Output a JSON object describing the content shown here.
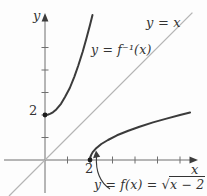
{
  "figure": {
    "type": "math-function-plot",
    "background": "#fdfdfd",
    "curve_color": "#3b3b3b",
    "identity_line_color": "#b5b5b5",
    "axis_color": "#6f6f6f",
    "text_color": "#333333"
  },
  "labels": {
    "y_axis": "y",
    "x_axis": "x",
    "y_intercept_tick": "2",
    "x_intercept_tick": "2",
    "inverse_curve": "y = f⁻¹(x)",
    "identity_line": "y = x",
    "f_curve_prefix": "y = f(x) = ",
    "f_curve_radical": "√",
    "f_curve_radicand": "x − 2"
  },
  "chart_data": {
    "type": "line",
    "xlabel": "x",
    "ylabel": "y",
    "xlim": [
      -1.8,
      6.8
    ],
    "ylim": [
      -1.6,
      6.5
    ],
    "grid": false,
    "x_ticks": [
      1,
      2,
      3,
      4,
      5,
      6
    ],
    "y_ticks": [
      1,
      2,
      3,
      4,
      5
    ],
    "series": [
      {
        "name": "y = x",
        "style": "identity",
        "points": [
          [
            -1.6,
            -1.6
          ],
          [
            6.55,
            6.55
          ]
        ]
      },
      {
        "name": "y = f(x) = √(x − 2)",
        "style": "curve",
        "points": [
          [
            2,
            0
          ],
          [
            2.02,
            0.14
          ],
          [
            2.05,
            0.22
          ],
          [
            2.12,
            0.35
          ],
          [
            2.25,
            0.5
          ],
          [
            2.5,
            0.71
          ],
          [
            2.8,
            0.89
          ],
          [
            3.2,
            1.1
          ],
          [
            3.7,
            1.3
          ],
          [
            4.2,
            1.48
          ],
          [
            4.8,
            1.67
          ],
          [
            5.4,
            1.84
          ],
          [
            6.0,
            2.0
          ],
          [
            6.45,
            2.11
          ]
        ]
      },
      {
        "name": "y = f⁻¹(x) = x² + 2",
        "style": "curve",
        "points": [
          [
            0,
            2
          ],
          [
            0.14,
            2.02
          ],
          [
            0.22,
            2.05
          ],
          [
            0.35,
            2.12
          ],
          [
            0.5,
            2.25
          ],
          [
            0.71,
            2.5
          ],
          [
            0.89,
            2.8
          ],
          [
            1.1,
            3.2
          ],
          [
            1.3,
            3.7
          ],
          [
            1.48,
            4.2
          ],
          [
            1.67,
            4.8
          ],
          [
            1.84,
            5.4
          ],
          [
            2.0,
            6.0
          ],
          [
            2.11,
            6.45
          ]
        ]
      }
    ],
    "points_of_interest": [
      {
        "x": 0,
        "y": 2,
        "label": "2"
      },
      {
        "x": 2,
        "y": 0,
        "label": "2"
      }
    ],
    "annotations": [
      {
        "text": "y = f(x) = √(x − 2)",
        "points_to": [
          2,
          0
        ],
        "arrow": "curved"
      }
    ]
  }
}
